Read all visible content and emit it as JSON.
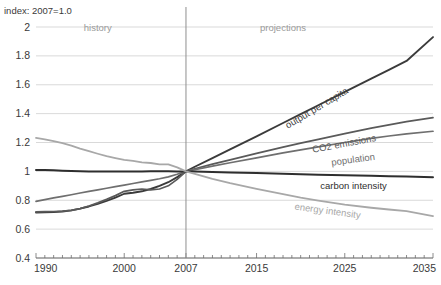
{
  "chart_data": {
    "type": "line",
    "title": "index: 2007=1.0",
    "xlabel": "",
    "ylabel": "index: 2007=1.0",
    "xlim": [
      1990,
      2035
    ],
    "ylim": [
      0.4,
      2.0
    ],
    "grid": true,
    "legend_position": "inline-end-of-line",
    "y_ticks": [
      "2",
      "1.8",
      "1.6",
      "1.4",
      "1.2",
      "1",
      "0.8",
      "0.6",
      "0.4"
    ],
    "y_tick_values": [
      2,
      1.8,
      1.6,
      1.4,
      1.2,
      1,
      0.8,
      0.6,
      0.4
    ],
    "x_ticks": [
      "1990",
      "2000",
      "2007",
      "2015",
      "2025",
      "2035"
    ],
    "x_tick_values": [
      1990,
      2000,
      2007,
      2015,
      2025,
      2035
    ],
    "annotations": [
      {
        "text": "history",
        "x": 1997,
        "y": 1.97,
        "color": "#9a9a9a"
      },
      {
        "text": "projections",
        "x": 2018,
        "y": 1.97,
        "color": "#9a9a9a"
      }
    ],
    "divider_year": 2007,
    "x": [
      1990,
      1991,
      1992,
      1993,
      1994,
      1995,
      1996,
      1997,
      1998,
      1999,
      2000,
      2001,
      2002,
      2003,
      2004,
      2005,
      2006,
      2007,
      2008,
      2010,
      2012,
      2015,
      2018,
      2020,
      2022,
      2025,
      2028,
      2030,
      2032,
      2035
    ],
    "series": [
      {
        "name": "output per capita",
        "color": "#3b3b3b",
        "width": 1.9,
        "label_x": 2022,
        "label_y": 1.42,
        "values": [
          0.715,
          0.716,
          0.718,
          0.722,
          0.73,
          0.742,
          0.757,
          0.775,
          0.795,
          0.818,
          0.845,
          0.852,
          0.862,
          0.878,
          0.9,
          0.925,
          0.96,
          1.0,
          1.032,
          1.092,
          1.152,
          1.243,
          1.335,
          1.396,
          1.458,
          1.55,
          1.642,
          1.703,
          1.765,
          1.93
        ]
      },
      {
        "name": "CO2 emissions",
        "color": "#5a5a5a",
        "width": 1.7,
        "label_x": 2025,
        "label_y": 1.17,
        "values": [
          0.72,
          0.721,
          0.722,
          0.724,
          0.73,
          0.742,
          0.76,
          0.782,
          0.806,
          0.832,
          0.862,
          0.872,
          0.878,
          0.872,
          0.878,
          0.9,
          0.945,
          1.0,
          1.018,
          1.05,
          1.08,
          1.125,
          1.168,
          1.196,
          1.222,
          1.262,
          1.3,
          1.322,
          1.344,
          1.372
        ]
      },
      {
        "name": "population",
        "color": "#6f6f6f",
        "width": 1.7,
        "label_x": 2026,
        "label_y": 1.06,
        "values": [
          0.792,
          0.804,
          0.816,
          0.827,
          0.838,
          0.85,
          0.861,
          0.872,
          0.883,
          0.894,
          0.905,
          0.916,
          0.927,
          0.938,
          0.949,
          0.962,
          0.98,
          1.0,
          1.012,
          1.036,
          1.06,
          1.094,
          1.128,
          1.149,
          1.17,
          1.2,
          1.228,
          1.245,
          1.26,
          1.278
        ]
      },
      {
        "name": "carbon intensity",
        "color": "#2e2e2e",
        "width": 2.0,
        "label_x": 2026,
        "label_y": 0.875,
        "values": [
          1.01,
          1.009,
          1.007,
          1.005,
          1.003,
          1.001,
          1.0,
          0.999,
          0.999,
          0.999,
          0.999,
          1.0,
          1.0,
          1.001,
          1.001,
          1.001,
          1.0,
          1.0,
          0.999,
          0.996,
          0.993,
          0.988,
          0.984,
          0.98,
          0.977,
          0.973,
          0.969,
          0.967,
          0.964,
          0.96
        ]
      },
      {
        "name": "energy intensity",
        "color": "#a8a8a8",
        "width": 1.8,
        "label_x": 2023,
        "label_y": 0.705,
        "values": [
          1.232,
          1.222,
          1.21,
          1.196,
          1.178,
          1.158,
          1.14,
          1.122,
          1.105,
          1.092,
          1.08,
          1.072,
          1.062,
          1.058,
          1.048,
          1.048,
          1.028,
          1.0,
          0.982,
          0.948,
          0.918,
          0.878,
          0.842,
          0.818,
          0.798,
          0.77,
          0.748,
          0.736,
          0.724,
          0.69
        ]
      }
    ]
  }
}
